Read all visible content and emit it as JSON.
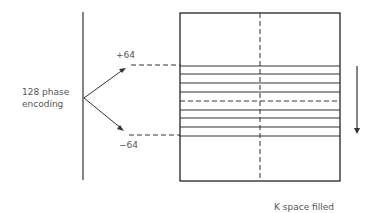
{
  "diagram": {
    "left_label_line1": "128 phase",
    "left_label_line2": "encoding",
    "top_marker": "+64",
    "bottom_marker": "−64",
    "caption": "K space filled",
    "line_color": "#333333",
    "k_space_lines": [
      66,
      74,
      83,
      92,
      101,
      110,
      118,
      127,
      136
    ],
    "center_line_index": 4,
    "fill_direction": "arrow-down"
  }
}
